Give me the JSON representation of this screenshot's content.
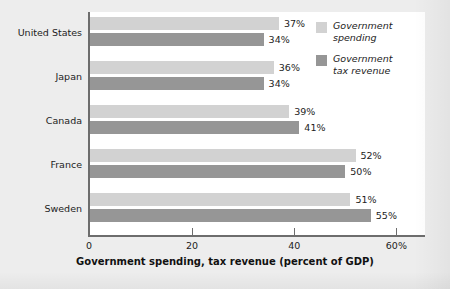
{
  "chart_data": {
    "type": "bar",
    "orientation": "horizontal",
    "title": "",
    "xlabel": "Government spending, tax revenue (percent of GDP)",
    "ylabel": "",
    "xlim": [
      0,
      66
    ],
    "xticks": [
      {
        "value": 0,
        "label": "0"
      },
      {
        "value": 20,
        "label": "20"
      },
      {
        "value": 40,
        "label": "40"
      },
      {
        "value": 60,
        "label": "60%"
      }
    ],
    "grid": false,
    "legend_position": "top-right",
    "categories": [
      "United States",
      "Japan",
      "Canada",
      "France",
      "Sweden"
    ],
    "series": [
      {
        "name": "Government spending",
        "color": "#d2d2d2",
        "values": [
          37,
          36,
          39,
          52,
          51
        ],
        "value_labels": [
          "37%",
          "36%",
          "39%",
          "52%",
          "51%"
        ]
      },
      {
        "name": "Government tax revenue",
        "color": "#969696",
        "values": [
          34,
          34,
          41,
          50,
          55
        ],
        "value_labels": [
          "34%",
          "34%",
          "41%",
          "50%",
          "55%"
        ]
      }
    ]
  },
  "legend": {
    "items": [
      {
        "label_line1": "Government",
        "label_line2": "spending",
        "swatch": "#d2d2d2"
      },
      {
        "label_line1": "Government",
        "label_line2": "tax revenue",
        "swatch": "#969696"
      }
    ]
  },
  "axis": {
    "x_title": "Government spending, tax revenue (percent of GDP)"
  },
  "colors": {
    "spending": "#d2d2d2",
    "revenue": "#969696",
    "panel": "#ffffff",
    "background": "#ededed",
    "axis": "#6d6d6d",
    "text": "#1c1c1c"
  }
}
